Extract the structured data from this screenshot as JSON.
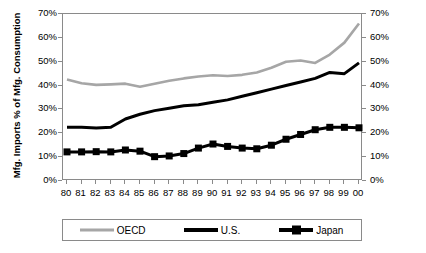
{
  "chart_data": {
    "type": "line",
    "title": "",
    "xlabel": "",
    "ylabel": "Mfg. Imports % of Mfg. Consumption",
    "ylim": [
      0,
      70
    ],
    "ytick_labels": [
      "0%",
      "10%",
      "20%",
      "30%",
      "40%",
      "50%",
      "60%",
      "70%"
    ],
    "ytick_values": [
      0,
      10,
      20,
      30,
      40,
      50,
      60,
      70
    ],
    "dual_axis": true,
    "right_axis_labels": [
      "0%",
      "10%",
      "20%",
      "30%",
      "40%",
      "50%",
      "60%",
      "70%"
    ],
    "grid": false,
    "legend_position": "bottom",
    "categories": [
      "80",
      "81",
      "82",
      "83",
      "84",
      "85",
      "86",
      "87",
      "88",
      "89",
      "90",
      "91",
      "92",
      "93",
      "94",
      "95",
      "96",
      "97",
      "98",
      "99",
      "00"
    ],
    "series": [
      {
        "name": "OECD",
        "color": "#a6a6a6",
        "marker": "none",
        "values": [
          42.5,
          41.0,
          40.3,
          40.5,
          40.8,
          39.5,
          40.8,
          42.0,
          43.0,
          43.8,
          44.3,
          44.0,
          44.5,
          45.5,
          47.5,
          50.0,
          50.5,
          49.5,
          53.0,
          58.0,
          66.0
        ]
      },
      {
        "name": "U.S.",
        "color": "#000000",
        "marker": "none",
        "values": [
          22.5,
          22.5,
          22.2,
          22.5,
          26.0,
          28.0,
          29.5,
          30.5,
          31.5,
          32.0,
          33.0,
          34.0,
          35.5,
          37.0,
          38.5,
          40.0,
          41.5,
          43.0,
          45.5,
          45.0,
          49.5
        ]
      },
      {
        "name": "Japan",
        "color": "#000000",
        "marker": "square",
        "values": [
          12.2,
          12.2,
          12.3,
          12.2,
          13.0,
          12.5,
          10.2,
          10.5,
          11.5,
          13.8,
          15.5,
          14.5,
          13.8,
          13.5,
          15.0,
          17.5,
          19.5,
          21.5,
          22.5,
          22.5,
          22.3
        ]
      }
    ]
  },
  "legend": {
    "items": [
      {
        "label": "OECD"
      },
      {
        "label": "U.S."
      },
      {
        "label": "Japan"
      }
    ]
  }
}
